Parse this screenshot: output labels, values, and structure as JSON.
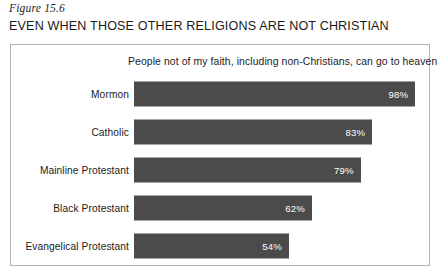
{
  "figure": {
    "caption": "Figure 15.6",
    "heading": "EVEN WHEN THOSE OTHER RELIGIONS ARE NOT CHRISTIAN"
  },
  "chart_data": {
    "type": "bar",
    "orientation": "horizontal",
    "title": "People not of my faith, including non-Christians, can go to heaven",
    "subtitle": "",
    "xlabel": "",
    "ylabel": "",
    "categories": [
      "Mormon",
      "Catholic",
      "Mainline Protestant",
      "Black Protestant",
      "Evangelical Protestant"
    ],
    "values": [
      98,
      83,
      79,
      62,
      54
    ],
    "value_labels": [
      "98%",
      "83%",
      "79%",
      "62%",
      "54%"
    ],
    "unit": "%",
    "xlim": [
      0,
      100
    ],
    "grid": false,
    "legend": false,
    "bar_color": "#4b4b4b",
    "value_label_color": "#ffffff",
    "frame_color": "#b4b4b4"
  }
}
